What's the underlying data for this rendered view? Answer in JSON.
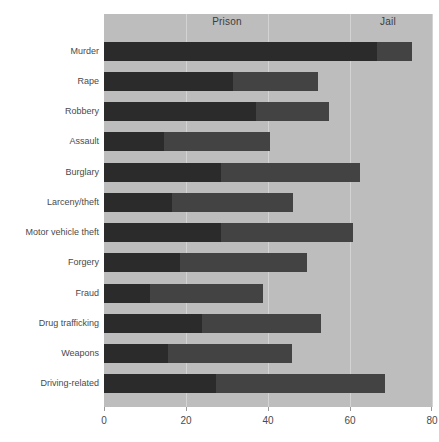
{
  "chart_data": {
    "type": "bar",
    "orientation": "horizontal",
    "stacked": true,
    "title": "",
    "subtitle": "",
    "xlabel": "",
    "ylabel": "",
    "xlim": [
      0,
      80
    ],
    "xticks": [
      0,
      20,
      40,
      60,
      80
    ],
    "xtick_labels": [
      "0",
      "20",
      "40",
      "60",
      "80"
    ],
    "grid": true,
    "grid_axis": "x",
    "legend_position": "top-inside",
    "legend": [
      "Prison",
      "Jail"
    ],
    "categories": [
      "Murder",
      "Rape",
      "Robbery",
      "Assault",
      "Burglary",
      "Larceny/theft",
      "Motor vehicle theft",
      "Forgery",
      "Fraud",
      "Drug trafficking",
      "Weapons",
      "Driving-related"
    ],
    "series": [
      {
        "name": "Prison",
        "color": "#2b2b2b",
        "values": [
          66.6,
          31.5,
          37.0,
          14.6,
          28.5,
          16.6,
          28.5,
          18.5,
          11.2,
          23.9,
          15.6,
          27.3
        ]
      },
      {
        "name": "Jail",
        "color": "#434343",
        "values": [
          8.5,
          20.7,
          18.0,
          25.9,
          33.9,
          29.5,
          32.2,
          31.0,
          27.6,
          29.0,
          30.2,
          41.2
        ]
      }
    ],
    "totals": [
      75.1,
      52.2,
      55.0,
      40.5,
      62.4,
      46.1,
      60.7,
      49.5,
      38.8,
      52.9,
      45.8,
      68.5
    ]
  },
  "legend": {
    "prison": "Prison",
    "jail": "Jail"
  },
  "axis": {
    "x_tick_0": "0",
    "x_tick_1": "20",
    "x_tick_2": "40",
    "x_tick_3": "60",
    "x_tick_4": "80"
  },
  "colors": {
    "prison": "#2b2b2b",
    "jail": "#434343",
    "plot_background": "#bdbdbd",
    "gridline": "#d3d3d3",
    "page_background": "#ffffff",
    "text": "#4a4a4a"
  }
}
